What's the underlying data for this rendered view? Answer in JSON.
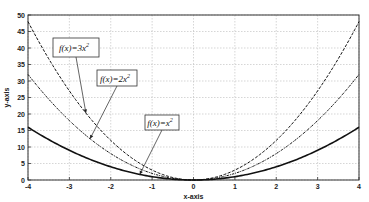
{
  "chart_data": {
    "type": "line",
    "title": "",
    "xlabel": "x-axis",
    "ylabel": "y-axis",
    "xlim": [
      -4,
      4
    ],
    "ylim": [
      0,
      50
    ],
    "grid": true,
    "xticks": [
      "-4",
      "-3",
      "-2",
      "-1",
      "0",
      "1",
      "2",
      "3",
      "4"
    ],
    "yticks": [
      "0",
      "5",
      "10",
      "15",
      "20",
      "25",
      "30",
      "35",
      "40",
      "45",
      "50"
    ],
    "series": [
      {
        "name": "f(x)=3x²",
        "coef": 3,
        "style": "dashed",
        "x": [
          -4,
          -3,
          -2,
          -1,
          0,
          1,
          2,
          3,
          4
        ],
        "y": [
          48,
          27,
          12,
          3,
          0,
          3,
          12,
          27,
          48
        ]
      },
      {
        "name": "f(x)=2x²",
        "coef": 2,
        "style": "dash-dot",
        "x": [
          -4,
          -3,
          -2,
          -1,
          0,
          1,
          2,
          3,
          4
        ],
        "y": [
          32,
          18,
          8,
          2,
          0,
          2,
          8,
          18,
          32
        ]
      },
      {
        "name": "f(x)=x²",
        "coef": 1,
        "style": "solid",
        "x": [
          -4,
          -3,
          -2,
          -1,
          0,
          1,
          2,
          3,
          4
        ],
        "y": [
          16,
          9,
          4,
          1,
          0,
          1,
          4,
          9,
          16
        ]
      }
    ],
    "annotations": [
      {
        "base": "f(x)=3x",
        "sup": "2",
        "points_to_x": -2.6
      },
      {
        "base": "f(x)=2x",
        "sup": "2",
        "points_to_x": -2.5
      },
      {
        "base": "f(x)=x",
        "sup": "2",
        "points_to_x": -1.3
      }
    ]
  }
}
